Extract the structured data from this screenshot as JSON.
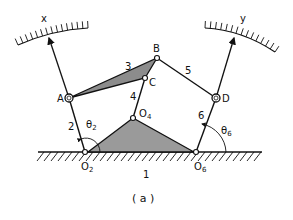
{
  "figure": {
    "caption": "( a )"
  },
  "labels": {
    "x_scale": "x",
    "y_scale": "y",
    "joint_A": "A",
    "joint_B": "B",
    "joint_C": "C",
    "joint_D": "D",
    "pivot_O2": "O",
    "pivot_O2_sub": "2",
    "pivot_O4": "O",
    "pivot_O4_sub": "4",
    "pivot_O6": "O",
    "pivot_O6_sub": "6",
    "link_1": "1",
    "link_2": "2",
    "link_3": "3",
    "link_4": "4",
    "link_5": "5",
    "link_6": "6",
    "theta2": "θ",
    "theta2_sub": "2",
    "theta6": "θ",
    "theta6_sub": "6"
  },
  "colors": {
    "stroke": "#111111",
    "fill_link": "#9a9a9a",
    "background": "#ffffff"
  }
}
